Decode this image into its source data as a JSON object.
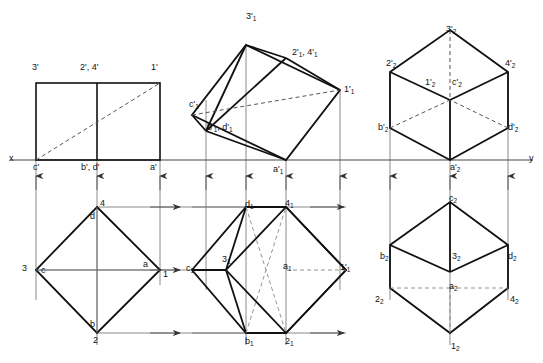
{
  "drawing": {
    "title": "Orthographic and auxiliary projections of a square pyramid",
    "type": "engineering-projection-drawing",
    "colors": {
      "background": "#ffffff",
      "outline": "#111111",
      "hidden_line": "#555555",
      "projector_line": "#6d6d6d",
      "reference_line": "#444444"
    },
    "reference_line": {
      "name": "xy-line",
      "y": 160,
      "left_label": "x",
      "right_label": "y"
    },
    "views": [
      {
        "id": "front-view",
        "name": "Front view (elevation)",
        "labels": [
          "3'",
          "2', 4'",
          "1'",
          "c'",
          "b', d'",
          "a'"
        ]
      },
      {
        "id": "auxiliary-elevation",
        "name": "Tilted auxiliary elevation",
        "labels": [
          "3'1",
          "2'1, 4'1",
          "1'1",
          "c'1",
          "b'1, d'1",
          "a'1"
        ]
      },
      {
        "id": "second-auxiliary-elevation",
        "name": "Second auxiliary elevation",
        "labels": [
          "3'2",
          "2'2",
          "4'2",
          "1'2",
          "c'2",
          "b'2",
          "d'2",
          "a'2"
        ]
      },
      {
        "id": "top-view",
        "name": "Top view (plan)",
        "labels": [
          "4",
          "3",
          "1",
          "2",
          "a",
          "b",
          "c",
          "d"
        ]
      },
      {
        "id": "auxiliary-plan",
        "name": "Auxiliary plan",
        "labels": [
          "d1",
          "41",
          "31",
          "c1",
          "a1",
          "1'1",
          "b1",
          "21"
        ]
      },
      {
        "id": "second-auxiliary-plan",
        "name": "Second auxiliary plan",
        "labels": [
          "c2",
          "b2",
          "32",
          "d2",
          "22",
          "a2",
          "42",
          "12"
        ]
      }
    ],
    "labels": [
      {
        "name": "label-3-prime",
        "text": "3'",
        "x": 32,
        "y": 63
      },
      {
        "name": "label-2-4-prime",
        "text": "2', 4'",
        "x": 80,
        "y": 63
      },
      {
        "name": "label-1-prime",
        "text": "1'",
        "x": 151,
        "y": 63
      },
      {
        "name": "label-c-prime",
        "text": "c'",
        "x": 33,
        "y": 163
      },
      {
        "name": "label-b-d-prime",
        "text": "b', d'",
        "x": 81,
        "y": 163
      },
      {
        "name": "label-a-prime",
        "text": "a'",
        "x": 150,
        "y": 163
      },
      {
        "name": "label-3-prime-1",
        "text": "3'",
        "sub": "1",
        "x": 246,
        "y": 12
      },
      {
        "name": "label-2-4-prime-1",
        "text": "2'",
        "sub": "1",
        "x": 292,
        "y": 48,
        "text2": ", 4'",
        "sub2": "1"
      },
      {
        "name": "label-1-prime-1",
        "text": "1'",
        "sub": "1",
        "x": 344,
        "y": 85
      },
      {
        "name": "label-c-prime-1",
        "text": "c'",
        "sub": "1",
        "x": 189,
        "y": 100
      },
      {
        "name": "label-b-d-prime-1",
        "text": "b'",
        "sub": "1",
        "x": 207,
        "y": 123,
        "text2": ", d'",
        "sub2": "1"
      },
      {
        "name": "label-a-prime-1",
        "text": "a'",
        "sub": "1",
        "x": 273,
        "y": 165
      },
      {
        "name": "label-3-prime-2",
        "text": "3'",
        "sub": "2",
        "x": 446,
        "y": 25
      },
      {
        "name": "label-2-prime-2",
        "text": "2'",
        "sub": "2",
        "x": 386,
        "y": 59
      },
      {
        "name": "label-4-prime-2",
        "text": "4'",
        "sub": "2",
        "x": 505,
        "y": 59
      },
      {
        "name": "label-1-prime-2",
        "text": "1'",
        "sub": "2",
        "x": 425,
        "y": 78
      },
      {
        "name": "label-c-prime-2",
        "text": "c'",
        "sub": "2",
        "x": 452,
        "y": 78
      },
      {
        "name": "label-b-prime-2",
        "text": "b'",
        "sub": "2",
        "x": 378,
        "y": 123
      },
      {
        "name": "label-d-prime-2",
        "text": "d'",
        "sub": "2",
        "x": 508,
        "y": 123
      },
      {
        "name": "label-a-prime-2",
        "text": "a'",
        "sub": "2",
        "x": 450,
        "y": 163
      },
      {
        "name": "label-4",
        "text": "4",
        "x": 100,
        "y": 199
      },
      {
        "name": "label-d",
        "text": "d",
        "x": 90,
        "y": 212
      },
      {
        "name": "label-3",
        "text": "3",
        "x": 22,
        "y": 264
      },
      {
        "name": "label-c",
        "text": "c",
        "x": 41,
        "y": 266
      },
      {
        "name": "label-a",
        "text": "a",
        "x": 143,
        "y": 260
      },
      {
        "name": "label-1",
        "text": "1",
        "x": 163,
        "y": 270
      },
      {
        "name": "label-b",
        "text": "b",
        "x": 90,
        "y": 320
      },
      {
        "name": "label-2",
        "text": "2",
        "x": 93,
        "y": 336
      },
      {
        "name": "label-d-1",
        "text": "d",
        "sub": "1",
        "x": 245,
        "y": 200
      },
      {
        "name": "label-4-1",
        "text": "4",
        "sub": "1",
        "x": 285,
        "y": 199
      },
      {
        "name": "label-3-1",
        "text": "3",
        "sub": "1",
        "x": 222,
        "y": 255
      },
      {
        "name": "label-c-1",
        "text": "c",
        "sub": "1",
        "x": 186,
        "y": 264
      },
      {
        "name": "label-a-1",
        "text": "a",
        "sub": "1",
        "x": 283,
        "y": 262
      },
      {
        "name": "label-1-prime-1b",
        "text": "1'",
        "sub": "1",
        "x": 340,
        "y": 263
      },
      {
        "name": "label-b-1",
        "text": "b",
        "sub": "1",
        "x": 245,
        "y": 337
      },
      {
        "name": "label-2-1",
        "text": "2",
        "sub": "1",
        "x": 285,
        "y": 337
      },
      {
        "name": "label-c-2",
        "text": "c",
        "sub": "2",
        "x": 449,
        "y": 194
      },
      {
        "name": "label-b-2",
        "text": "b",
        "sub": "2",
        "x": 380,
        "y": 252
      },
      {
        "name": "label-3-2",
        "text": "3",
        "sub": "2",
        "x": 452,
        "y": 252
      },
      {
        "name": "label-d-2",
        "text": "d",
        "sub": "2",
        "x": 508,
        "y": 252
      },
      {
        "name": "label-2-2",
        "text": "2",
        "sub": "2",
        "x": 375,
        "y": 295
      },
      {
        "name": "label-a-2",
        "text": "a",
        "sub": "2",
        "x": 449,
        "y": 282
      },
      {
        "name": "label-4-2",
        "text": "4",
        "sub": "2",
        "x": 510,
        "y": 295
      },
      {
        "name": "label-1-2",
        "text": "1",
        "sub": "2",
        "x": 451,
        "y": 342
      }
    ]
  }
}
